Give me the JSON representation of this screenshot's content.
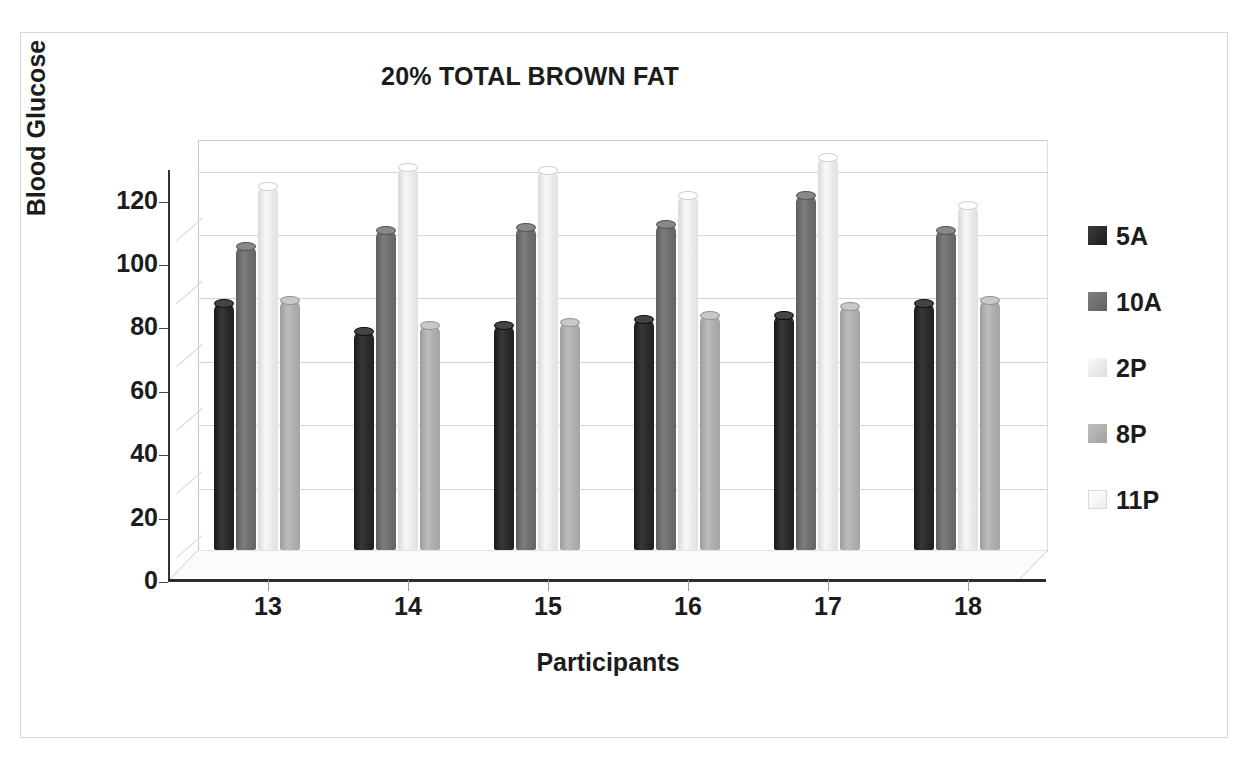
{
  "chart_data": {
    "type": "bar",
    "title": "20% TOTAL BROWN FAT",
    "xlabel": "Participants",
    "ylabel": "Blood Glucose",
    "categories": [
      "13",
      "14",
      "15",
      "16",
      "17",
      "18"
    ],
    "yticks": [
      0,
      20,
      40,
      60,
      80,
      100,
      120
    ],
    "ylim": [
      0,
      130
    ],
    "grid": true,
    "legend_position": "right",
    "style": "3d-cylinder-clustered-column",
    "series": [
      {
        "name": "5A",
        "color": "#2a2a2a",
        "values": [
          78,
          69,
          71,
          73,
          74,
          78
        ]
      },
      {
        "name": "10A",
        "color": "#6e6e6e",
        "values": [
          96,
          101,
          102,
          103,
          112,
          101
        ]
      },
      {
        "name": "2P",
        "color": "#eaeaea",
        "values": [
          115,
          121,
          120,
          112,
          124,
          109
        ]
      },
      {
        "name": "8P",
        "color": "#aeaeae",
        "values": [
          79,
          71,
          72,
          74,
          77,
          79
        ]
      },
      {
        "name": "11P",
        "color": "#fcfcfc",
        "values": [
          0,
          0,
          0,
          0,
          0,
          0
        ]
      }
    ]
  },
  "legend": {
    "items": [
      {
        "label": "5A",
        "color": "#2a2a2a"
      },
      {
        "label": "10A",
        "color": "#6e6e6e"
      },
      {
        "label": "2P",
        "color": "#eaeaea"
      },
      {
        "label": "8P",
        "color": "#aeaeae"
      },
      {
        "label": "11P",
        "color": "#fcfcfc"
      }
    ]
  },
  "colors": {
    "background": "#ffffff",
    "frame": "#d8d8d8",
    "axis": "#333333",
    "gridline": "#d5d5d5",
    "baseline": "#2b2b2b",
    "text": "#1c1c1c"
  }
}
